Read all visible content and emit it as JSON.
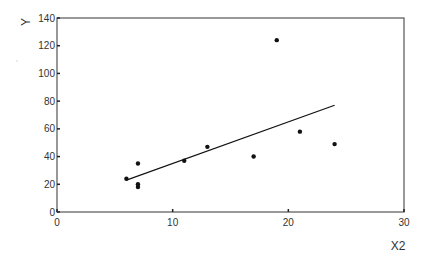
{
  "chart_data": {
    "type": "scatter",
    "title": "",
    "xlabel": "X2",
    "ylabel": "Y",
    "xlim": [
      0,
      30
    ],
    "ylim": [
      0,
      140
    ],
    "xticks": [
      0,
      10,
      20,
      30
    ],
    "yticks": [
      0,
      20,
      40,
      60,
      80,
      100,
      120,
      140
    ],
    "grid": false,
    "legend": null,
    "series": [
      {
        "name": "observations",
        "type": "scatter",
        "points": [
          {
            "x": 6,
            "y": 24
          },
          {
            "x": 7,
            "y": 35
          },
          {
            "x": 7,
            "y": 20
          },
          {
            "x": 7,
            "y": 18
          },
          {
            "x": 11,
            "y": 37
          },
          {
            "x": 13,
            "y": 47
          },
          {
            "x": 17,
            "y": 40
          },
          {
            "x": 19,
            "y": 124
          },
          {
            "x": 21,
            "y": 58
          },
          {
            "x": 24,
            "y": 49
          }
        ]
      },
      {
        "name": "fit line",
        "type": "line",
        "points": [
          {
            "x": 6,
            "y": 23
          },
          {
            "x": 24,
            "y": 77
          }
        ]
      }
    ]
  },
  "labels": {
    "x_axis": "X2",
    "y_axis": "Y"
  }
}
